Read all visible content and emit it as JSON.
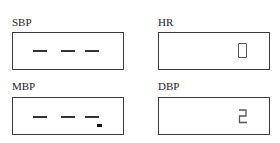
{
  "panels": [
    {
      "label": "SBP",
      "value": "- - -"
    },
    {
      "label": "HR",
      "value": "0"
    },
    {
      "label": "MBP",
      "value": "- - -"
    },
    {
      "label": "DBP",
      "value": "2"
    }
  ]
}
